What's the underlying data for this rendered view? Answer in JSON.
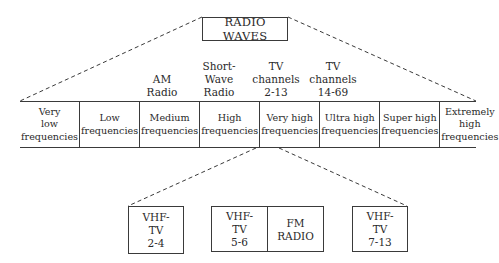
{
  "diagram": {
    "title": "RADIO WAVES",
    "band_labels": [
      {
        "id": "am-radio",
        "text": "AM\nRadio",
        "above_band_index": 2
      },
      {
        "id": "short-wave-radio",
        "text": "Short-\nWave\nRadio",
        "above_band_index": 3
      },
      {
        "id": "tv-channels-2-13",
        "text": "TV\nchannels\n2-13",
        "above_band_index": 4
      },
      {
        "id": "tv-channels-14-69",
        "text": "TV\nchannels\n14-69",
        "above_band_index": 5
      }
    ],
    "bands": [
      "Very\nlow\nfrequencies",
      "Low\nfrequencies",
      "Medium\nfrequencies",
      "High\nfrequencies",
      "Very high\nfrequencies",
      "Ultra high\nfrequencies",
      "Super high\nfrequencies",
      "Extremely\nhigh\nfrequencies"
    ],
    "vhf_breakdown": {
      "expanded_band_index": 4,
      "boxes": [
        {
          "text": "VHF-\nTV\n2-4"
        },
        {
          "left": "VHF-\nTV\n5-6",
          "right": "FM\nRADIO"
        },
        {
          "text": "VHF-\nTV\n7-13"
        }
      ]
    },
    "colors": {
      "line": "#3a3a3a",
      "text": "#2a2a2a",
      "background": "#ffffff"
    }
  }
}
